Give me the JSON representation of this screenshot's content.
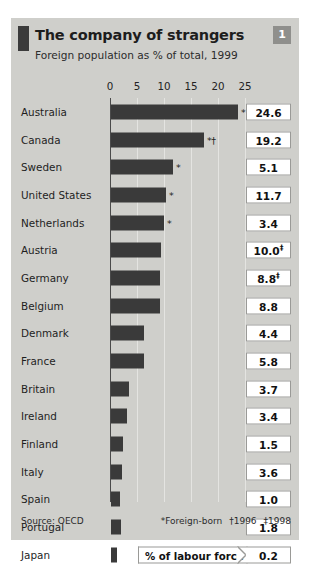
{
  "header": {
    "title": "The company of strangers",
    "subtitle": "Foreign population as % of total, 1999",
    "badge": "1"
  },
  "legend": {
    "bar_series_label": "% of labour force"
  },
  "footer": {
    "source": "Source: OECD",
    "footnote_star": "*Foreign-born",
    "footnote_dagger": "†1996",
    "footnote_ddagger": "‡1998"
  },
  "chart_data": {
    "type": "bar",
    "title": "The company of strangers",
    "subtitle": "Foreign population as % of total, 1999",
    "xlabel": "",
    "ylabel": "",
    "xlim": [
      0,
      25
    ],
    "ticks": [
      0,
      5,
      10,
      15,
      20,
      25
    ],
    "tick_labels": [
      "0",
      "5",
      "10",
      "15",
      "20",
      "25"
    ],
    "grid": true,
    "orientation": "horizontal",
    "legend_position": "bottom-inside",
    "categories": [
      "Australia",
      "Canada",
      "Sweden",
      "United States",
      "Netherlands",
      "Austria",
      "Germany",
      "Belgium",
      "Denmark",
      "France",
      "Britain",
      "Ireland",
      "Finland",
      "Italy",
      "Spain",
      "Portugal",
      "Japan"
    ],
    "series": [
      {
        "name": "% of labour force",
        "render": "bar",
        "values": [
          23.5,
          17.2,
          11.5,
          10.2,
          9.8,
          9.2,
          9.0,
          9.0,
          6.1,
          6.2,
          3.3,
          2.9,
          2.2,
          2.0,
          1.6,
          1.8,
          1.2
        ]
      },
      {
        "name": "Foreign population as % of total, 1999",
        "render": "value-box",
        "values": [
          24.6,
          19.2,
          5.1,
          11.7,
          3.4,
          10.0,
          8.8,
          8.8,
          4.4,
          5.8,
          3.7,
          3.4,
          1.5,
          3.6,
          1.0,
          1.8,
          0.2
        ]
      }
    ],
    "rows": [
      {
        "label": "Australia",
        "bar": 23.5,
        "value": "24.6",
        "value_sup": "",
        "bar_mark": "*"
      },
      {
        "label": "Canada",
        "bar": 17.2,
        "value": "19.2",
        "value_sup": "",
        "bar_mark": "*†"
      },
      {
        "label": "Sweden",
        "bar": 11.5,
        "value": "5.1",
        "value_sup": "",
        "bar_mark": "*"
      },
      {
        "label": "United States",
        "bar": 10.2,
        "value": "11.7",
        "value_sup": "",
        "bar_mark": "*"
      },
      {
        "label": "Netherlands",
        "bar": 9.8,
        "value": "3.4",
        "value_sup": "",
        "bar_mark": "*"
      },
      {
        "label": "Austria",
        "bar": 9.2,
        "value": "10.0",
        "value_sup": "‡",
        "bar_mark": ""
      },
      {
        "label": "Germany",
        "bar": 9.0,
        "value": "8.8",
        "value_sup": "‡",
        "bar_mark": ""
      },
      {
        "label": "Belgium",
        "bar": 9.0,
        "value": "8.8",
        "value_sup": "",
        "bar_mark": ""
      },
      {
        "label": "Denmark",
        "bar": 6.1,
        "value": "4.4",
        "value_sup": "",
        "bar_mark": ""
      },
      {
        "label": "France",
        "bar": 6.2,
        "value": "5.8",
        "value_sup": "",
        "bar_mark": ""
      },
      {
        "label": "Britain",
        "bar": 3.3,
        "value": "3.7",
        "value_sup": "",
        "bar_mark": ""
      },
      {
        "label": "Ireland",
        "bar": 2.9,
        "value": "3.4",
        "value_sup": "",
        "bar_mark": ""
      },
      {
        "label": "Finland",
        "bar": 2.2,
        "value": "1.5",
        "value_sup": "",
        "bar_mark": ""
      },
      {
        "label": "Italy",
        "bar": 2.0,
        "value": "3.6",
        "value_sup": "",
        "bar_mark": ""
      },
      {
        "label": "Spain",
        "bar": 1.6,
        "value": "1.0",
        "value_sup": "",
        "bar_mark": ""
      },
      {
        "label": "Portugal",
        "bar": 1.8,
        "value": "1.8",
        "value_sup": "",
        "bar_mark": ""
      },
      {
        "label": "Japan",
        "bar": 1.2,
        "value": "0.2",
        "value_sup": "",
        "bar_mark": ""
      }
    ]
  }
}
